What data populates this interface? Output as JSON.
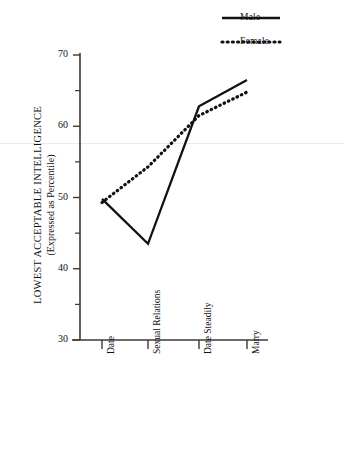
{
  "chart_data": {
    "type": "line",
    "title": "",
    "xlabel": "",
    "ylabel": "LOWEST ACCEPTABLE INTELLIGENCE",
    "ylabel_sub": "(Expressed as Percentile)",
    "categories": [
      "Date",
      "Sexual Relations",
      "Date Steadily",
      "Marry"
    ],
    "ylim": [
      30,
      70
    ],
    "yticks": [
      30,
      40,
      50,
      60,
      70
    ],
    "yticks_minor": [
      35,
      45,
      55,
      65
    ],
    "ytick_labels": [
      "30",
      "40",
      "50",
      "60",
      "70"
    ],
    "grid": false,
    "legend_position": "top-right",
    "series": [
      {
        "name": "Male",
        "style": "solid",
        "color": "#111111",
        "values": [
          49.8,
          43.5,
          62.8,
          66.5
        ]
      },
      {
        "name": "Female",
        "style": "dotted",
        "color": "#111111",
        "values": [
          49.3,
          54.3,
          61.5,
          64.8
        ]
      }
    ]
  },
  "legend": {
    "items": [
      {
        "label": "Male"
      },
      {
        "label": "Female"
      }
    ]
  },
  "axes": {
    "y_axis_name": "y-axis",
    "x_axis_name": "x-axis"
  }
}
